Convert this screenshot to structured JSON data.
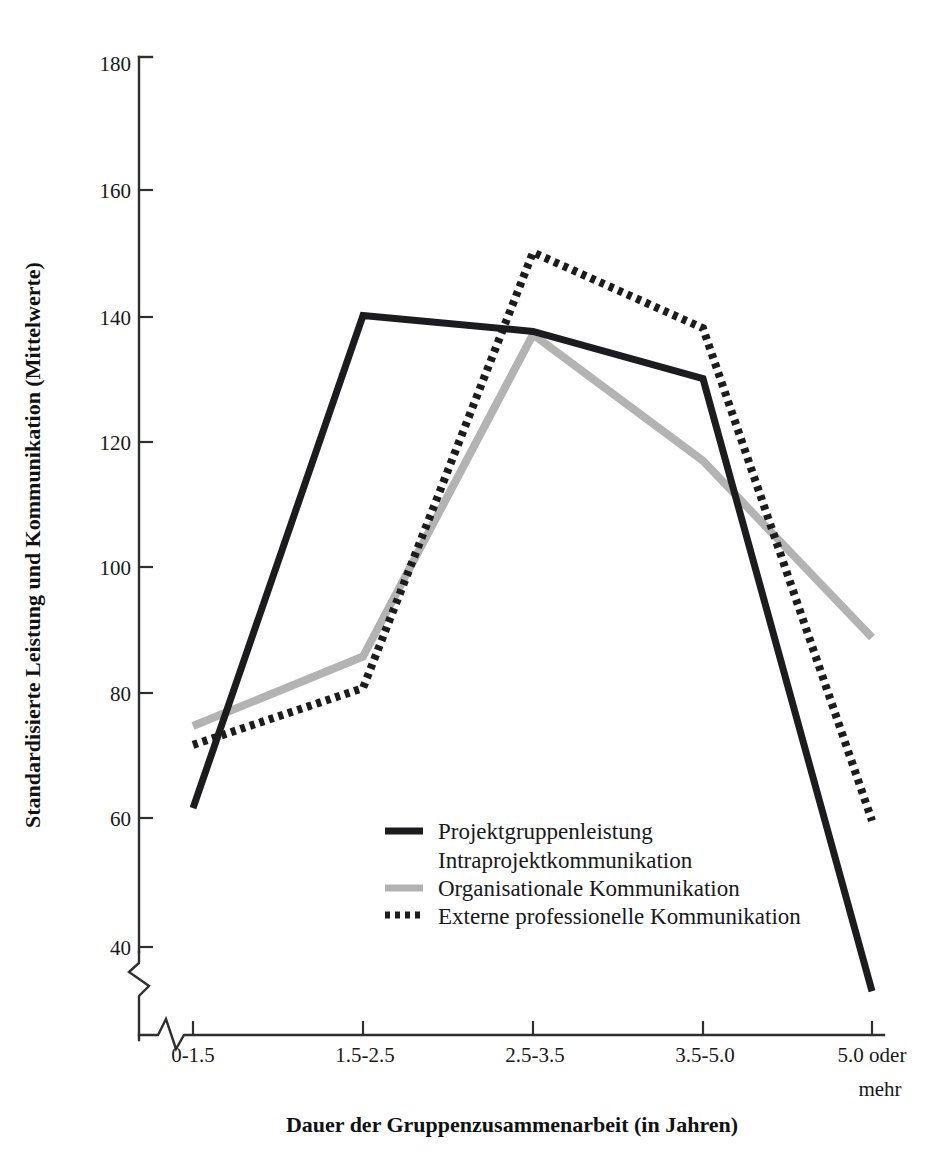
{
  "chart_data": {
    "type": "line",
    "title": "",
    "xlabel": "Dauer der Gruppenzusammenarbeit (in Jahren)",
    "ylabel": "Standardisierte Leistung und Kommunikation (Mittelwerte)",
    "categories": [
      "0-1.5",
      "1.5-2.5",
      "2.5-3.5",
      "3.5-5.0",
      "5.0 oder mehr"
    ],
    "x_tick_labels": [
      "0-1.5",
      "1.5-2.5",
      "2.5-3.5",
      "3.5-5.0",
      "5.0 oder"
    ],
    "x_tick_label_second_line": "mehr",
    "y_tick_labels": [
      "180",
      "160",
      "140",
      "120",
      "100",
      "80",
      "60",
      "40"
    ],
    "y_tick_values": [
      180,
      160,
      140,
      120,
      100,
      80,
      60,
      40
    ],
    "ylim": [
      28,
      180
    ],
    "y_axis_break": true,
    "x_axis_break": true,
    "grid": false,
    "legend_position": "inside-center-bottom",
    "series": [
      {
        "name": "Projektgruppenleistung / Intraprojektkommunikation",
        "style": "solid-thick-black",
        "color": "#1c1c1e",
        "values": [
          62,
          140,
          137.5,
          130,
          33
        ]
      },
      {
        "name": "Organisationale Kommunikation",
        "style": "solid-thick-gray",
        "color": "#b3b3b3",
        "values": [
          75,
          86,
          137,
          117,
          89
        ]
      },
      {
        "name": "Externe professionelle Kommunikation",
        "style": "dotted-black",
        "color": "#1c1c1e",
        "values": [
          72,
          81,
          150,
          138,
          60
        ]
      }
    ]
  },
  "legend": {
    "entries": [
      {
        "label": "Projektgruppenleistung",
        "swatch": "solid-thick-black",
        "color": "#1c1c1e"
      },
      {
        "label": "Intraprojektkommunikation",
        "swatch": "none",
        "color": "#1c1c1e"
      },
      {
        "label": "Organisationale Kommunikation",
        "swatch": "solid-thick-gray",
        "color": "#b3b3b3"
      },
      {
        "label": "Externe professionelle Kommunikation",
        "swatch": "dotted-black",
        "color": "#1c1c1e"
      }
    ]
  },
  "axes": {
    "y_title": "Standardisierte Leistung und Kommunikation (Mittelwerte)",
    "x_title": "Dauer der Gruppenzusammenarbeit (in Jahren)",
    "y_ticks": [
      {
        "label": "180",
        "y": 63
      },
      {
        "label": "160",
        "y": 190
      },
      {
        "label": "140",
        "y": 317
      },
      {
        "label": "120",
        "y": 442
      },
      {
        "label": "100",
        "y": 567
      },
      {
        "label": "80",
        "y": 693
      },
      {
        "label": "60",
        "y": 818
      },
      {
        "label": "40",
        "y": 947
      }
    ],
    "x_ticks": [
      {
        "label": "0-1.5",
        "x": 193
      },
      {
        "label": "1.5-2.5",
        "x": 363
      },
      {
        "label": "2.5-3.5",
        "x": 533
      },
      {
        "label": "3.5-5.0",
        "x": 703
      },
      {
        "label": "5.0 oder",
        "x": 872
      }
    ]
  }
}
